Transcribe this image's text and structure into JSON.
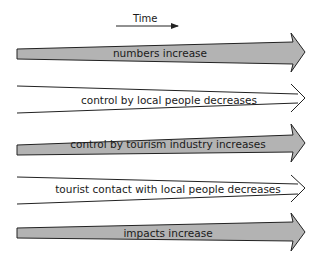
{
  "diagram": {
    "time_label": "Time",
    "colors": {
      "filled_arrow": "#b3b3b3",
      "open_arrow": "#ffffff",
      "stroke": "#222222"
    },
    "arrows": [
      {
        "label": "numbers increase",
        "style": "filled"
      },
      {
        "label": "control by local people decreases",
        "style": "open"
      },
      {
        "label": "control by tourism industry increases",
        "style": "filled"
      },
      {
        "label": "tourist contact with local people decreases",
        "style": "open"
      },
      {
        "label": "impacts increase",
        "style": "filled"
      }
    ]
  }
}
